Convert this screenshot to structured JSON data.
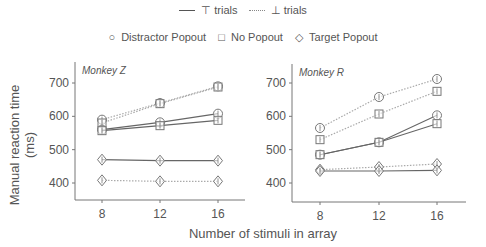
{
  "legend": {
    "line_styles": [
      {
        "style": "solid",
        "label": "⊤ trials"
      },
      {
        "style": "dotted",
        "label": "⊥ trials"
      }
    ],
    "conditions": [
      {
        "marker": "circle",
        "symbol": "○",
        "label": "Distractor Popout"
      },
      {
        "marker": "square",
        "symbol": "□",
        "label": "No Popout"
      },
      {
        "marker": "diamond",
        "symbol": "◇",
        "label": "Target Popout"
      }
    ]
  },
  "ylabel": "Manual reaction time (ms)",
  "xlabel": "Number of stimuli in array",
  "chart_data": [
    {
      "type": "line",
      "title": "Monkey Z",
      "x": [
        8,
        12,
        16
      ],
      "xlabel": "Number of stimuli in array",
      "ylabel": "Manual reaction time (ms)",
      "ylim": [
        350,
        730
      ],
      "yticks": [
        400,
        500,
        600,
        700
      ],
      "grid": false,
      "series": [
        {
          "name": "Distractor Popout (⊥ trials)",
          "style": "dotted",
          "marker": "circle",
          "values": [
            590,
            640,
            690
          ]
        },
        {
          "name": "No Popout (⊥ trials)",
          "style": "dotted",
          "marker": "square",
          "values": [
            580,
            638,
            688
          ]
        },
        {
          "name": "Distractor Popout (⊤ trials)",
          "style": "solid",
          "marker": "circle",
          "values": [
            560,
            582,
            608
          ]
        },
        {
          "name": "No Popout (⊤ trials)",
          "style": "solid",
          "marker": "square",
          "values": [
            557,
            572,
            588
          ]
        },
        {
          "name": "Target Popout (⊤ trials)",
          "style": "solid",
          "marker": "diamond",
          "values": [
            470,
            467,
            467
          ]
        },
        {
          "name": "Target Popout (⊥ trials)",
          "style": "dotted",
          "marker": "diamond",
          "values": [
            408,
            405,
            405
          ]
        }
      ]
    },
    {
      "type": "line",
      "title": "Monkey R",
      "x": [
        8,
        12,
        16
      ],
      "xlabel": "Number of stimuli in array",
      "ylabel": "",
      "ylim": [
        350,
        730
      ],
      "yticks": [
        400,
        500,
        600,
        700
      ],
      "grid": false,
      "series": [
        {
          "name": "Distractor Popout (⊥ trials)",
          "style": "dotted",
          "marker": "circle",
          "values": [
            565,
            658,
            712
          ]
        },
        {
          "name": "No Popout (⊥ trials)",
          "style": "dotted",
          "marker": "square",
          "values": [
            530,
            607,
            675
          ]
        },
        {
          "name": "Distractor Popout (⊤ trials)",
          "style": "solid",
          "marker": "circle",
          "values": [
            485,
            522,
            603
          ]
        },
        {
          "name": "No Popout (⊤ trials)",
          "style": "solid",
          "marker": "square",
          "values": [
            485,
            522,
            578
          ]
        },
        {
          "name": "Target Popout (⊥ trials)",
          "style": "dotted",
          "marker": "diamond",
          "values": [
            440,
            448,
            457
          ]
        },
        {
          "name": "Target Popout (⊤ trials)",
          "style": "solid",
          "marker": "diamond",
          "values": [
            436,
            436,
            438
          ]
        }
      ]
    }
  ]
}
